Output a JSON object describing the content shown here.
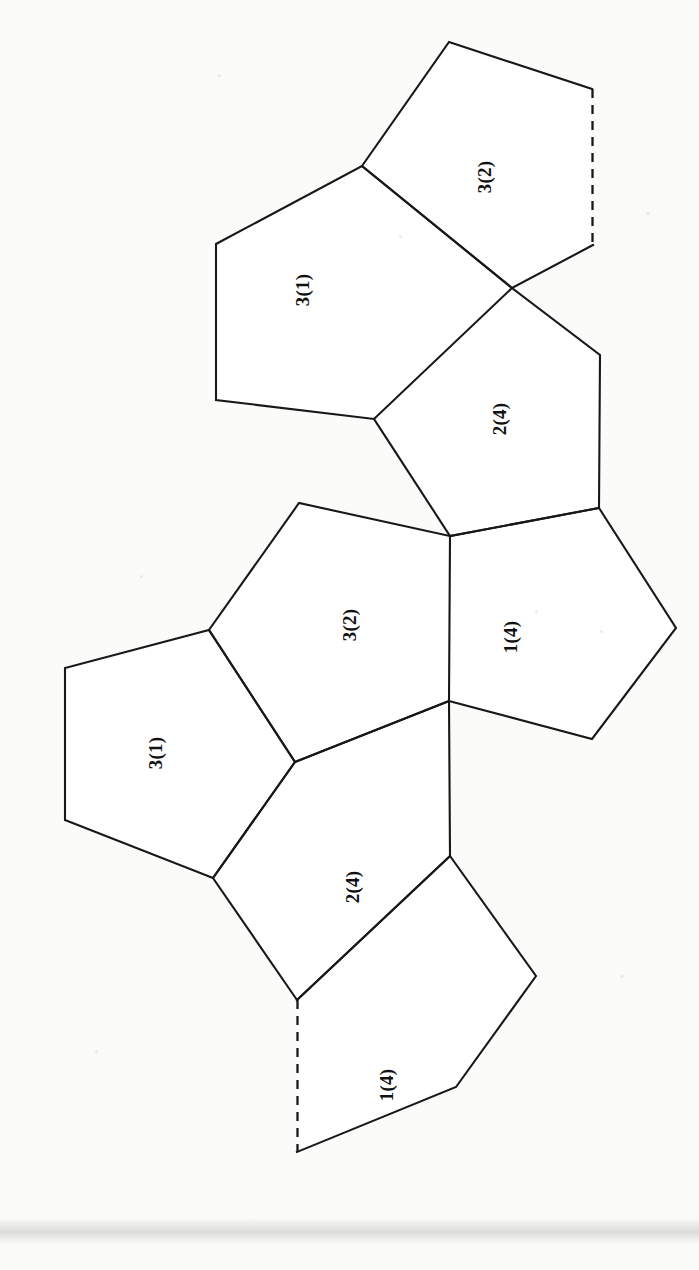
{
  "figure": {
    "type": "polygon-net-diagram",
    "background_color": "#fbfbf9",
    "line_color": "#181818",
    "label_rotation_deg": -90,
    "canvas": {
      "width": 699,
      "height": 1270
    }
  },
  "faces": [
    {
      "id": "face-top-3-2",
      "label": "3(2)",
      "label_x": 487,
      "label_y": 177,
      "points": "449,42 592,89 593,245 512,288 362,166",
      "dashed_edges": [
        {
          "x1": 592.5,
          "y1": 89,
          "x2": 592.5,
          "y2": 245
        }
      ],
      "solid_path": "M 592,89 L 449,42 L 362,166 L 512,288 L 593,245"
    },
    {
      "id": "face-top-3-1",
      "label": "3(1)",
      "label_x": 305,
      "label_y": 290,
      "points": "362,166 512,288 374,419 216,400 216,244",
      "solid_path": "M 362,166 L 512,288 L 374,419 L 216,400 L 216,244 Z"
    },
    {
      "id": "face-top-2-4",
      "label": "2(4)",
      "label_x": 502,
      "label_y": 419,
      "points": "512,288 600,355 599,508 450,536 374,419",
      "solid_path": "M 512,288 L 600,355 L 599,508 L 450,536 L 374,419"
    },
    {
      "id": "face-mid-3-2",
      "label": "3(2)",
      "label_x": 352,
      "label_y": 625,
      "points": "450,536 449,701 295,762 209,630 299,503",
      "solid_path": "M 450,536 L 449,701 L 295,762 L 209,630 L 299,503 Z"
    },
    {
      "id": "face-mid-1-4",
      "label": "1(4)",
      "label_x": 513,
      "label_y": 637,
      "points": "450,536 599,508 676,628 592,739 449,701",
      "solid_path": "M 450,536 L 599,508 L 676,628 L 592,739 L 449,701"
    },
    {
      "id": "face-low-3-1",
      "label": "3(1)",
      "label_x": 158,
      "label_y": 753,
      "points": "295,762 213,878 65,820 65,668 209,630",
      "solid_path": "M 295,762 L 213,878 L 65,820 L 65,668 L 209,630 Z"
    },
    {
      "id": "face-low-2-4",
      "label": "2(4)",
      "label_x": 355,
      "label_y": 887,
      "points": "295,762 449,701 450,856 297,1000 213,878",
      "solid_path": "M 295,762 L 449,701 L 450,856 L 297,1000 L 213,878 Z"
    },
    {
      "id": "face-bottom-1-4",
      "label": "1(4)",
      "label_x": 389,
      "label_y": 1085,
      "points": "297,1000 450,856 536,976 456,1087 297,1152",
      "dashed_edges": [
        {
          "x1": 297.5,
          "y1": 1000,
          "x2": 297.5,
          "y2": 1152
        }
      ],
      "solid_path": "M 297,1000 L 450,856 L 536,976 L 456,1087 L 297,1152"
    }
  ],
  "artifacts": {
    "scan_band": {
      "top": 1218,
      "height": 26,
      "color": "#d6d6d4"
    }
  }
}
